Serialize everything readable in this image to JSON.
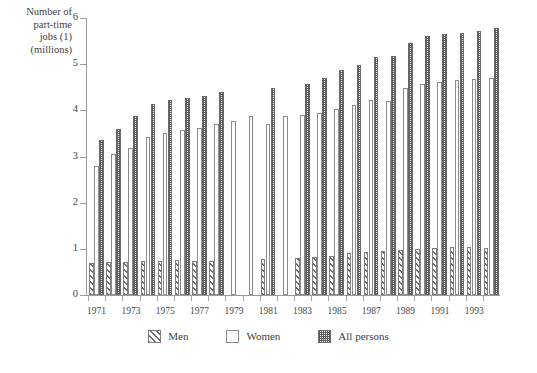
{
  "chart_data": {
    "type": "bar",
    "title": "",
    "subtitle": "",
    "ylabel": "Number of\npart-time\njobs (1)\n(millions)",
    "xlabel": "",
    "ylim": [
      0,
      6
    ],
    "y_ticks": [
      "0",
      "1",
      "2",
      "3",
      "4",
      "5",
      "6"
    ],
    "y_tick_values": [
      0,
      1,
      2,
      3,
      4,
      5,
      6
    ],
    "grid": false,
    "legend_position": "bottom",
    "categories": [
      "1971",
      "1972",
      "1973",
      "1974",
      "1975",
      "1976",
      "1977",
      "1978",
      "1979",
      "1980",
      "1981",
      "1982",
      "1983",
      "1984",
      "1985",
      "1986",
      "1987",
      "1988",
      "1989",
      "1990",
      "1991",
      "1992",
      "1993",
      "1994"
    ],
    "x_tick_labels": [
      "1971",
      "",
      "1973",
      "",
      "1975",
      "",
      "1977",
      "",
      "1979",
      "",
      "1981",
      "",
      "1983",
      "",
      "1985",
      "",
      "1987",
      "",
      "1989",
      "",
      "1991",
      "",
      "1993",
      ""
    ],
    "series": [
      {
        "name": "Men",
        "pattern": "diagonal-hatch",
        "values": [
          0.7,
          0.72,
          0.72,
          0.74,
          0.74,
          0.75,
          0.74,
          0.74,
          null,
          null,
          0.78,
          null,
          0.8,
          0.82,
          0.85,
          0.9,
          0.93,
          0.95,
          0.98,
          1.0,
          1.02,
          1.03,
          1.05,
          1.02
        ]
      },
      {
        "name": "Women",
        "pattern": "open",
        "values": [
          2.8,
          3.05,
          3.18,
          3.42,
          3.5,
          3.58,
          3.62,
          3.7,
          3.78,
          3.88,
          3.7,
          3.88,
          3.9,
          3.95,
          4.02,
          4.12,
          4.22,
          4.2,
          4.48,
          4.58,
          4.62,
          4.65,
          4.68,
          4.7
        ]
      },
      {
        "name": "All persons",
        "pattern": "checkerboard",
        "values": [
          3.35,
          3.6,
          3.88,
          4.14,
          4.22,
          4.27,
          4.32,
          4.4,
          null,
          null,
          4.48,
          null,
          4.58,
          4.7,
          4.88,
          4.98,
          5.15,
          5.18,
          5.45,
          5.62,
          5.65,
          5.68,
          5.72,
          5.78
        ]
      }
    ],
    "legend": [
      {
        "label": "Men",
        "pattern": "diagonal-hatch"
      },
      {
        "label": "Women",
        "pattern": "open"
      },
      {
        "label": "All persons",
        "pattern": "checkerboard"
      }
    ],
    "colors": {
      "ink": "#3f3f3f",
      "axis": "#9a9a9a",
      "bar_outline": "#7d7d7d",
      "hatch": "#6d6d6d",
      "checker": "#5c5c5c",
      "background": "#ffffff"
    }
  }
}
